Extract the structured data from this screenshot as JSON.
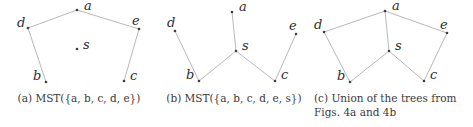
{
  "figure": {
    "background_color": "#ffffff",
    "edge_color": "#b9b9b9",
    "node_color": "#3d3d3d",
    "text_color": "#3a3a3a",
    "panels": [
      {
        "id": "a",
        "caption_lines": [
          "(a) MST({a, b, c, d, e})"
        ],
        "nodes": [
          {
            "id": "a",
            "label": "a",
            "x": 77,
            "y": 10,
            "lx": 84,
            "ly": 10
          },
          {
            "id": "d",
            "label": "d",
            "x": 28,
            "y": 28,
            "lx": 17,
            "ly": 27
          },
          {
            "id": "e",
            "label": "e",
            "x": 139,
            "y": 29,
            "lx": 132,
            "ly": 25
          },
          {
            "id": "s",
            "label": "s",
            "x": 77,
            "y": 49,
            "lx": 83,
            "ly": 49
          },
          {
            "id": "b",
            "label": "b",
            "x": 46,
            "y": 82,
            "lx": 33,
            "ly": 80
          },
          {
            "id": "c",
            "label": "c",
            "x": 124,
            "y": 81,
            "lx": 130,
            "ly": 80
          }
        ],
        "edges": [
          [
            "d",
            "a"
          ],
          [
            "a",
            "e"
          ],
          [
            "d",
            "b"
          ],
          [
            "e",
            "c"
          ]
        ]
      },
      {
        "id": "b",
        "caption_lines": [
          "(b) MST({a, b, c, d, e, s})"
        ],
        "nodes": [
          {
            "id": "a",
            "label": "a",
            "x": 74,
            "y": 12,
            "lx": 81,
            "ly": 11
          },
          {
            "id": "d",
            "label": "d",
            "x": 17,
            "y": 31,
            "lx": 9,
            "ly": 27
          },
          {
            "id": "e",
            "label": "e",
            "x": 138,
            "y": 34,
            "lx": 131,
            "ly": 30
          },
          {
            "id": "s",
            "label": "s",
            "x": 78,
            "y": 51,
            "lx": 84,
            "ly": 50
          },
          {
            "id": "b",
            "label": "b",
            "x": 41,
            "y": 81,
            "lx": 28,
            "ly": 79
          },
          {
            "id": "c",
            "label": "c",
            "x": 117,
            "y": 81,
            "lx": 123,
            "ly": 79
          }
        ],
        "edges": [
          [
            "a",
            "s"
          ],
          [
            "d",
            "b"
          ],
          [
            "b",
            "s"
          ],
          [
            "s",
            "c"
          ],
          [
            "c",
            "e"
          ]
        ]
      },
      {
        "id": "c",
        "caption_lines": [
          "(c) Union of the trees from",
          "Figs. 4a and 4b"
        ],
        "nodes": [
          {
            "id": "a",
            "label": "a",
            "x": 75,
            "y": 11,
            "lx": 82,
            "ly": 10
          },
          {
            "id": "d",
            "label": "d",
            "x": 14,
            "y": 32,
            "lx": 4,
            "ly": 29
          },
          {
            "id": "e",
            "label": "e",
            "x": 137,
            "y": 33,
            "lx": 130,
            "ly": 29
          },
          {
            "id": "s",
            "label": "s",
            "x": 79,
            "y": 51,
            "lx": 85,
            "ly": 50
          },
          {
            "id": "b",
            "label": "b",
            "x": 40,
            "y": 82,
            "lx": 27,
            "ly": 80
          },
          {
            "id": "c",
            "label": "c",
            "x": 114,
            "y": 81,
            "lx": 120,
            "ly": 79
          }
        ],
        "edges": [
          [
            "d",
            "a"
          ],
          [
            "a",
            "e"
          ],
          [
            "d",
            "b"
          ],
          [
            "e",
            "c"
          ],
          [
            "a",
            "s"
          ],
          [
            "b",
            "s"
          ],
          [
            "s",
            "c"
          ]
        ]
      }
    ]
  }
}
